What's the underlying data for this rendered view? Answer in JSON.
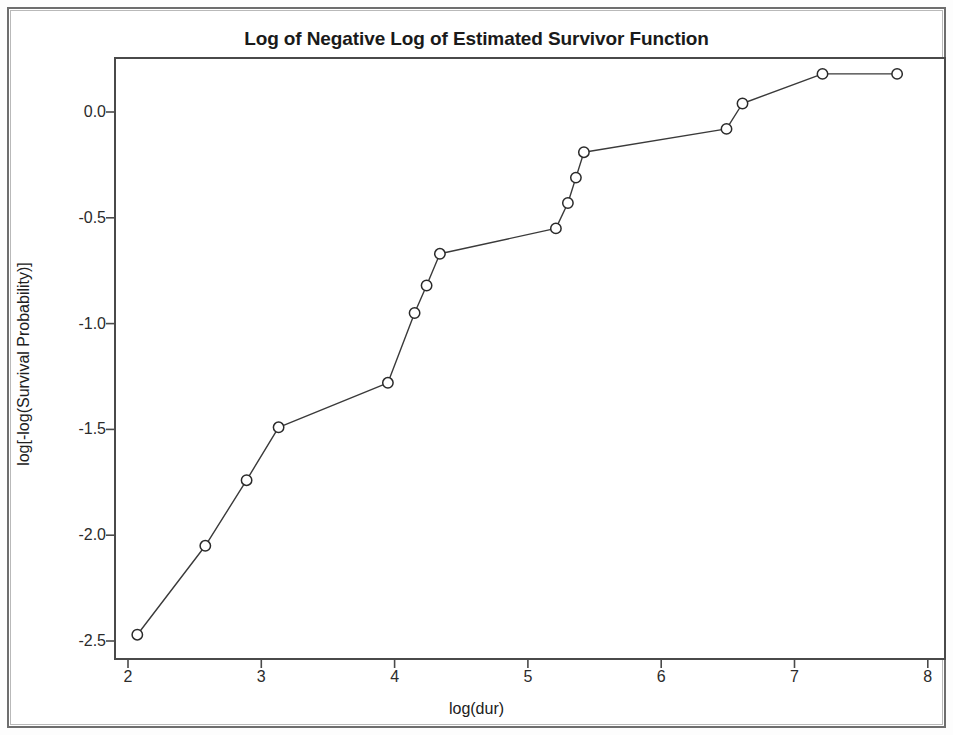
{
  "figure": {
    "title": "Log of Negative Log of Estimated Survivor Function",
    "x_axis_title": "log(dur)",
    "y_axis_title": "log[-log(Survival Probability)]"
  },
  "axes": {
    "x_ticks": [
      "2",
      "3",
      "4",
      "5",
      "6",
      "7",
      "8"
    ],
    "y_ticks": [
      "0.0",
      "-0.5",
      "-1.0",
      "-1.5",
      "-2.0",
      "-2.5"
    ]
  },
  "style": {
    "line_color": "#3a3a3a",
    "marker_edge_color": "#2a2a2a",
    "marker_face_color": "#ffffff",
    "axis_color": "#4a4a4a",
    "background_color": "#ffffff"
  },
  "chart_data": {
    "type": "line",
    "title": "Log of Negative Log of Estimated Survivor Function",
    "xlabel": "log(dur)",
    "ylabel": "log[-log(Survival Probability)]",
    "xlim": [
      2.0,
      8.0
    ],
    "ylim": [
      -2.6,
      0.29
    ],
    "grid": false,
    "legend": null,
    "marker": "circle-open",
    "series": [
      {
        "name": "log[-log(S(t))]",
        "x": [
          2.07,
          2.58,
          2.89,
          3.13,
          3.95,
          4.15,
          4.24,
          4.34,
          5.21,
          5.3,
          5.36,
          5.42,
          6.49,
          6.61,
          7.21,
          7.77
        ],
        "y": [
          -2.47,
          -2.05,
          -1.74,
          -1.49,
          -1.28,
          -0.95,
          -0.82,
          -0.67,
          -0.55,
          -0.43,
          -0.31,
          -0.19,
          -0.08,
          0.04,
          0.18,
          0.18
        ]
      }
    ]
  }
}
